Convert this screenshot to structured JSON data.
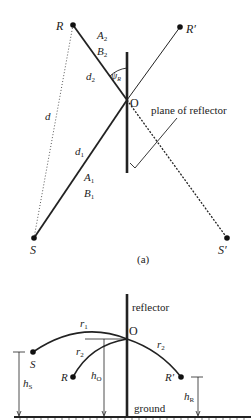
{
  "figure_a": {
    "caption": "(a)",
    "points": {
      "R": "R",
      "R_prime": "R′",
      "S": "S",
      "S_prime": "S′",
      "O": "O"
    },
    "labels": {
      "A2": "A",
      "A2_sub": "2",
      "B2": "B",
      "B2_sub": "2",
      "d2": "d",
      "d2_sub": "2",
      "d1": "d",
      "d1_sub": "1",
      "A1": "A",
      "A1_sub": "1",
      "B1": "B",
      "B1_sub": "1",
      "d": "d",
      "psi": "ψ",
      "psi_sub": "R",
      "plane": "plane of reflector"
    }
  },
  "figure_b": {
    "points": {
      "S": "S",
      "R": "R",
      "R_prime": "R′",
      "O": "O"
    },
    "labels": {
      "reflector": "reflector",
      "ground": "ground",
      "r1": "r",
      "r1_sub": "1",
      "r2a": "r",
      "r2a_sub": "2",
      "r2b": "r",
      "r2b_sub": "2",
      "hS": "h",
      "hS_sub": "S",
      "hO": "h",
      "hO_sub": "O",
      "hR": "h",
      "hR_sub": "R"
    }
  },
  "colors": {
    "ink": "#222222",
    "background": "#ffffff"
  }
}
